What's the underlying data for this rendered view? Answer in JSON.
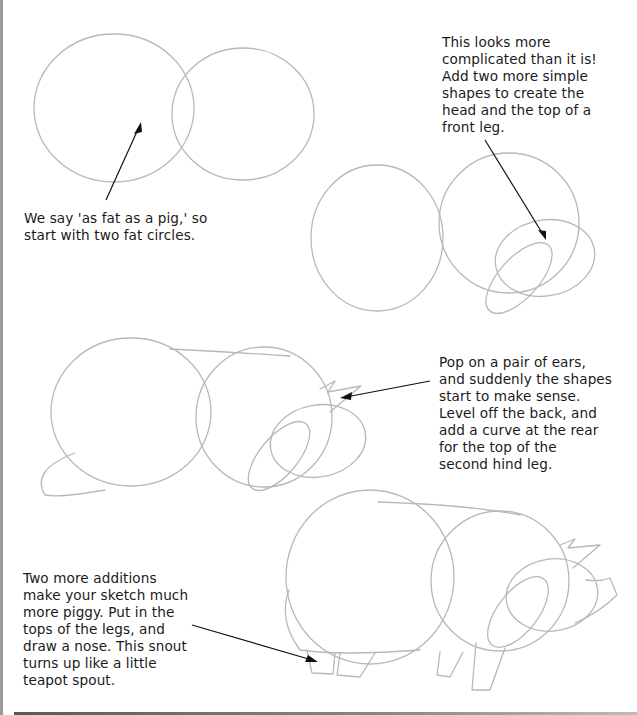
{
  "steps": [
    {
      "id": 1,
      "caption": "We say 'as fat as a pig,' so\nstart with two fat circles."
    },
    {
      "id": 2,
      "caption": "This looks more\ncomplicated than it is!\nAdd two more simple\nshapes to create the\nhead and the top of a\nfront leg."
    },
    {
      "id": 3,
      "caption": "Pop on a pair of ears,\nand suddenly the shapes\nstart to make sense.\nLevel off the back, and\nadd a curve at the rear\nfor the top of the\nsecond hind leg."
    },
    {
      "id": 4,
      "caption": "Two more additions\nmake your sketch much\nmore piggy. Put in the\ntops of the legs, and\ndraw a nose. This snout\nturns up like a little\nteapot spout."
    }
  ],
  "colors": {
    "pencil": "#b8b8b8",
    "ink": "#111111",
    "edge": "#9a9a9a"
  }
}
